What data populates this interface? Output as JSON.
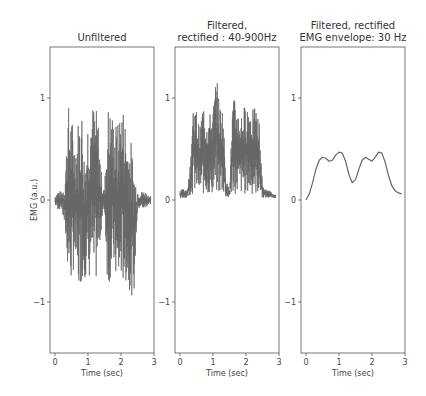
{
  "figure": {
    "ylabel": "EMG (a.u.)",
    "xlabel": "Time (sec)",
    "line_color": "#666666"
  },
  "panels": [
    {
      "title_lines": [
        "Unfiltered"
      ],
      "xlabel": "Time (sec)",
      "xticks": [
        "0",
        "1",
        "2",
        "3"
      ],
      "yticks": [
        "1",
        "0",
        "−1"
      ]
    },
    {
      "title_lines": [
        "Filtered,",
        "rectified : 40-900Hz"
      ],
      "xlabel": "Time (sec)",
      "xticks": [
        "0",
        "1",
        "2",
        "3"
      ],
      "yticks": [
        "1",
        "0",
        "−1"
      ]
    },
    {
      "title_lines": [
        "Filtered, rectified",
        "EMG envelope: 30 Hz"
      ],
      "xlabel": "Time (sec)",
      "xticks": [
        "0",
        "1",
        "2",
        "3"
      ],
      "yticks": [
        "1",
        "0",
        "−1"
      ]
    }
  ],
  "chart_data": [
    {
      "type": "line",
      "title": "Unfiltered",
      "xlabel": "Time (sec)",
      "ylabel": "EMG (a.u.)",
      "xlim": [
        -0.15,
        3.0
      ],
      "ylim": [
        -1.5,
        1.5
      ],
      "xticks": [
        0,
        1,
        2,
        3
      ],
      "yticks": [
        -1,
        0,
        1
      ],
      "description": "Raw EMG: baseline noise ~±0.1 around 0 for t<0.3, 1.5-1.7 and t>2.5; two bursts (~0.3-1.4 s and ~1.6-2.5 s) oscillating between about -1.0 and +1.0",
      "x": [
        0.0,
        0.1,
        0.2,
        0.3,
        0.4,
        0.5,
        0.6,
        0.7,
        0.8,
        0.9,
        1.0,
        1.1,
        1.2,
        1.3,
        1.4,
        1.5,
        1.6,
        1.7,
        1.8,
        1.9,
        2.0,
        2.1,
        2.2,
        2.3,
        2.4,
        2.5,
        2.6,
        2.7,
        2.8,
        2.9
      ],
      "y_max": [
        0.05,
        0.1,
        0.08,
        0.2,
        0.95,
        0.85,
        0.6,
        0.8,
        0.98,
        0.4,
        0.9,
        0.95,
        0.95,
        0.85,
        0.3,
        0.1,
        0.95,
        0.9,
        0.8,
        0.75,
        0.98,
        0.9,
        0.65,
        0.6,
        0.35,
        0.1,
        0.08,
        0.1,
        0.06,
        0.04
      ],
      "y_min": [
        -0.05,
        -0.1,
        -0.08,
        -0.3,
        -0.75,
        -0.85,
        -0.6,
        -0.95,
        -0.8,
        -0.75,
        -0.9,
        -0.65,
        -0.9,
        -0.7,
        -0.3,
        -0.1,
        -0.9,
        -0.75,
        -0.7,
        -0.95,
        -0.8,
        -0.85,
        -0.8,
        -0.95,
        -0.9,
        -0.1,
        -0.08,
        -0.1,
        -0.06,
        -0.04
      ]
    },
    {
      "type": "line",
      "title": "Filtered, rectified : 40-900Hz",
      "xlabel": "Time (sec)",
      "xlim": [
        -0.15,
        3.0
      ],
      "ylim": [
        -1.5,
        1.5
      ],
      "xticks": [
        0,
        1,
        2,
        3
      ],
      "yticks": [
        -1,
        0,
        1
      ],
      "description": "Rectified EMG: baseline ~0.05-0.1 at rest; bursts reaching ~0.7-1.0 with one peak ~1.25 near t=1.1 s",
      "x": [
        0.0,
        0.1,
        0.2,
        0.3,
        0.4,
        0.5,
        0.6,
        0.7,
        0.8,
        0.9,
        1.0,
        1.1,
        1.2,
        1.3,
        1.4,
        1.5,
        1.6,
        1.7,
        1.8,
        1.9,
        2.0,
        2.1,
        2.2,
        2.3,
        2.4,
        2.5,
        2.6,
        2.7,
        2.8,
        2.9
      ],
      "y_max": [
        0.1,
        0.12,
        0.08,
        0.3,
        0.98,
        0.9,
        0.7,
        0.98,
        0.85,
        0.85,
        0.9,
        1.25,
        0.95,
        0.92,
        0.2,
        0.1,
        1.0,
        0.98,
        0.85,
        0.9,
        0.95,
        0.98,
        0.9,
        0.9,
        0.8,
        0.15,
        0.1,
        0.1,
        0.06,
        0.05
      ],
      "y_min": [
        0.0,
        0.02,
        0.02,
        0.05,
        0.05,
        0.08,
        0.05,
        0.05,
        0.05,
        0.05,
        0.05,
        0.05,
        0.05,
        0.05,
        0.02,
        0.02,
        0.05,
        0.05,
        0.05,
        0.05,
        0.05,
        0.05,
        0.05,
        0.05,
        0.05,
        0.02,
        0.02,
        0.02,
        0.02,
        0.02
      ]
    },
    {
      "type": "line",
      "title": "Filtered, rectified EMG envelope: 30 Hz",
      "xlabel": "Time (sec)",
      "xlim": [
        -0.15,
        3.0
      ],
      "ylim": [
        -1.5,
        1.5
      ],
      "xticks": [
        0,
        1,
        2,
        3
      ],
      "yticks": [
        -1,
        0,
        1
      ],
      "x": [
        0.0,
        0.1,
        0.2,
        0.3,
        0.4,
        0.5,
        0.6,
        0.7,
        0.8,
        0.9,
        1.0,
        1.1,
        1.2,
        1.3,
        1.4,
        1.5,
        1.6,
        1.7,
        1.8,
        1.9,
        2.0,
        2.1,
        2.2,
        2.3,
        2.4,
        2.5,
        2.6,
        2.7,
        2.8,
        2.9
      ],
      "y": [
        0.0,
        0.06,
        0.17,
        0.3,
        0.39,
        0.42,
        0.41,
        0.38,
        0.39,
        0.44,
        0.47,
        0.46,
        0.38,
        0.25,
        0.17,
        0.2,
        0.3,
        0.39,
        0.42,
        0.4,
        0.38,
        0.42,
        0.47,
        0.46,
        0.37,
        0.24,
        0.14,
        0.09,
        0.07,
        0.06
      ]
    }
  ]
}
